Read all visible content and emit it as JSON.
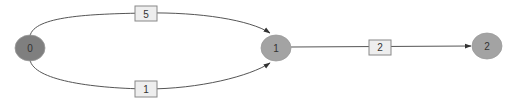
{
  "diagram": {
    "type": "directed-weighted-graph",
    "nodes": [
      {
        "id": "0",
        "label": "0",
        "fill": "#7f7f7f"
      },
      {
        "id": "1",
        "label": "1",
        "fill": "#a3a3a3"
      },
      {
        "id": "2",
        "label": "2",
        "fill": "#a3a3a3"
      }
    ],
    "edges": [
      {
        "from": "0",
        "to": "1",
        "weight": "5"
      },
      {
        "from": "0",
        "to": "1",
        "weight": "1"
      },
      {
        "from": "1",
        "to": "2",
        "weight": "2"
      }
    ]
  }
}
